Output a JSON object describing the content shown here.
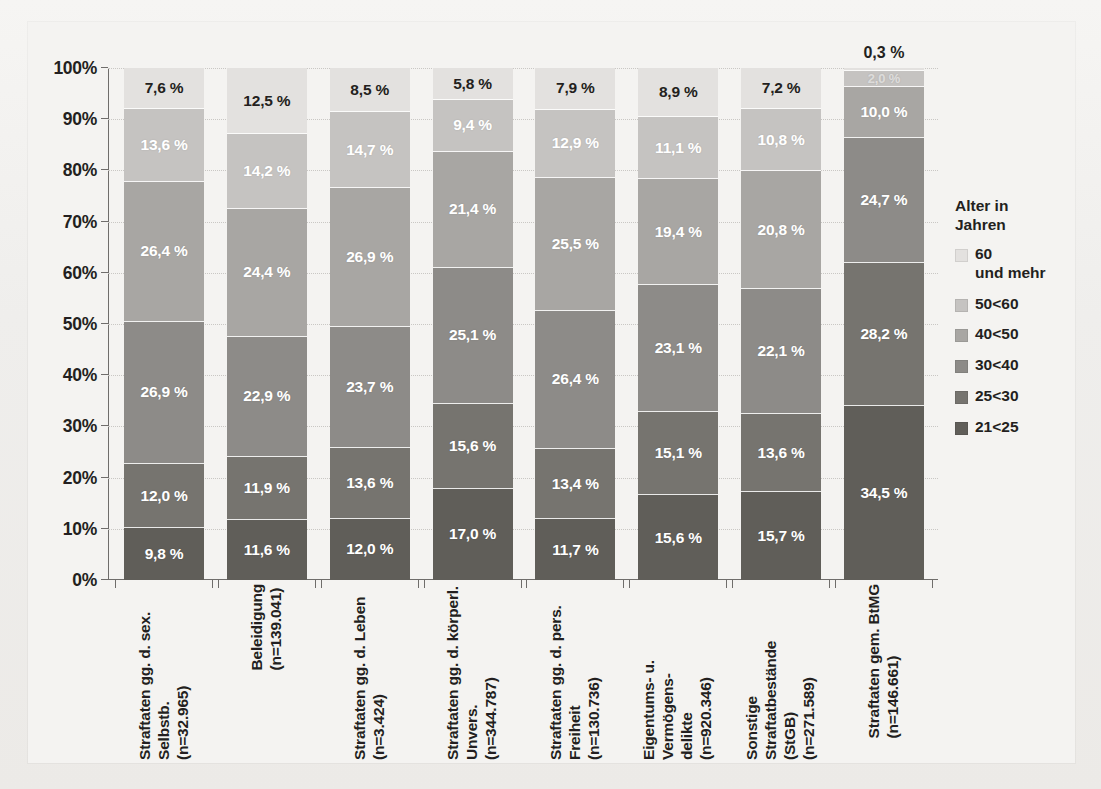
{
  "chart_data": {
    "type": "bar",
    "subtype": "stacked-100-percent",
    "title": "",
    "xlabel": "",
    "ylabel": "",
    "ylim": [
      0,
      100
    ],
    "ytick_labels": [
      "0%",
      "10%",
      "20%",
      "30%",
      "40%",
      "50%",
      "60%",
      "70%",
      "80%",
      "90%",
      "100%"
    ],
    "ytick_values": [
      0,
      10,
      20,
      30,
      40,
      50,
      60,
      70,
      80,
      90,
      100
    ],
    "grid": true,
    "legend_position": "right",
    "legend_title": "Alter in\nJahren",
    "categories": [
      "Straftaten gg. d. sex. Selbstb.\n(n=32.965)",
      "Beleidigung\n(n=139.041)",
      "Straftaten gg. d. Leben (n=3.424)",
      "Straftaten gg. d. körperl. Unvers.\n(n=344.787)",
      "Straftaten gg. d. pers. Freiheit\n(n=130.736)",
      "Eigentums- u. Vermögens-\ndelikte\n(n=920.346)",
      "Sonstige Straftatbestände\n(StGB)\n(n=271.589)",
      "Straftaten gem. BtMG\n(n=146.661)"
    ],
    "series": [
      {
        "name": "60 und mehr",
        "color": "#e3e1df",
        "values": [
          7.6,
          12.5,
          8.5,
          5.8,
          7.9,
          8.9,
          7.2,
          0.3
        ]
      },
      {
        "name": "50<60",
        "color": "#c5c3c1",
        "values": [
          13.6,
          14.2,
          14.7,
          9.4,
          12.9,
          11.1,
          10.8,
          2.0
        ]
      },
      {
        "name": "40<50",
        "color": "#a8a6a3",
        "values": [
          26.4,
          24.4,
          26.9,
          21.4,
          25.5,
          19.4,
          20.8,
          10.0
        ]
      },
      {
        "name": "30<40",
        "color": "#8d8b88",
        "values": [
          26.9,
          22.9,
          23.7,
          25.1,
          26.4,
          23.1,
          22.1,
          24.7
        ]
      },
      {
        "name": "25<30",
        "color": "#76746f",
        "values": [
          12.0,
          11.9,
          13.6,
          15.6,
          13.4,
          15.1,
          13.6,
          28.2
        ]
      },
      {
        "name": "21<25",
        "color": "#605e59",
        "values": [
          9.8,
          11.6,
          12.0,
          17.0,
          11.7,
          15.6,
          15.7,
          34.5
        ]
      }
    ],
    "value_labels": [
      [
        "7,6 %",
        "13,6 %",
        "26,4 %",
        "26,9 %",
        "12,0 %",
        "9,8 %"
      ],
      [
        "12,5 %",
        "14,2 %",
        "24,4 %",
        "22,9 %",
        "11,9 %",
        "11,6 %"
      ],
      [
        "8,5 %",
        "14,7 %",
        "26,9 %",
        "23,7 %",
        "13,6 %",
        "12,0 %"
      ],
      [
        "5,8 %",
        "9,4 %",
        "21,4 %",
        "25,1 %",
        "15,6 %",
        "17,0 %"
      ],
      [
        "7,9 %",
        "12,9 %",
        "25,5 %",
        "26,4 %",
        "13,4 %",
        "11,7 %"
      ],
      [
        "8,9 %",
        "11,1 %",
        "19,4 %",
        "23,1 %",
        "15,1 %",
        "15,6 %"
      ],
      [
        "7,2 %",
        "10,8 %",
        "20,8 %",
        "22,1 %",
        "13,6 %",
        "15,7 %"
      ],
      [
        "0,3 %",
        "2,0 %",
        "10,0 %",
        "24,7 %",
        "28,2 %",
        "34,5 %"
      ]
    ],
    "legend_entries": [
      {
        "label": "60\nund mehr",
        "color": "#e3e1df"
      },
      {
        "label": "50<60",
        "color": "#c5c3c1"
      },
      {
        "label": "40<50",
        "color": "#a8a6a3"
      },
      {
        "label": "30<40",
        "color": "#8d8b88"
      },
      {
        "label": "25<30",
        "color": "#76746f"
      },
      {
        "label": "21<25",
        "color": "#605e59"
      }
    ]
  }
}
